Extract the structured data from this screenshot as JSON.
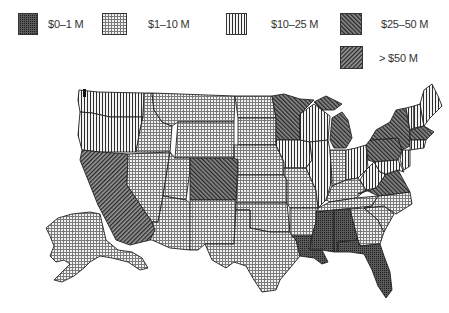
{
  "legend": {
    "items": [
      {
        "label": "$0–1 M",
        "pattern": "dense-dots",
        "color": "#3a3a3a"
      },
      {
        "label": "$1–10 M",
        "pattern": "grid",
        "color": "#8a8a8a"
      },
      {
        "label": "$10–25 M",
        "pattern": "vertical-lines",
        "color": "#444444"
      },
      {
        "label": "$25–50 M",
        "pattern": "diagonal-back",
        "color": "#444444"
      },
      {
        "label": "> $50 M",
        "pattern": "diagonal-forward",
        "color": "#444444"
      }
    ]
  },
  "map": {
    "title": "United States map shaded by funding category",
    "states": [
      {
        "name": "Washington",
        "category": "$10–25 M"
      },
      {
        "name": "Oregon",
        "category": "$10–25 M"
      },
      {
        "name": "California",
        "category": "> $50 M"
      },
      {
        "name": "Idaho",
        "category": "$1–10 M"
      },
      {
        "name": "Nevada",
        "category": "$1–10 M"
      },
      {
        "name": "Montana",
        "category": "$1–10 M"
      },
      {
        "name": "Wyoming",
        "category": "$1–10 M"
      },
      {
        "name": "Utah",
        "category": "$1–10 M"
      },
      {
        "name": "Arizona",
        "category": "$1–10 M"
      },
      {
        "name": "Colorado",
        "category": "$25–50 M"
      },
      {
        "name": "New Mexico",
        "category": "$1–10 M"
      },
      {
        "name": "North Dakota",
        "category": "$1–10 M"
      },
      {
        "name": "South Dakota",
        "category": "$1–10 M"
      },
      {
        "name": "Nebraska",
        "category": "$1–10 M"
      },
      {
        "name": "Kansas",
        "category": "$1–10 M"
      },
      {
        "name": "Oklahoma",
        "category": "$1–10 M"
      },
      {
        "name": "Texas",
        "category": "$1–10 M"
      },
      {
        "name": "Minnesota",
        "category": "$25–50 M"
      },
      {
        "name": "Iowa",
        "category": "$10–25 M"
      },
      {
        "name": "Missouri",
        "category": "$1–10 M"
      },
      {
        "name": "Arkansas",
        "category": "$1–10 M"
      },
      {
        "name": "Louisiana",
        "category": "$0–1 M"
      },
      {
        "name": "Wisconsin",
        "category": "$10–25 M"
      },
      {
        "name": "Illinois",
        "category": "$10–25 M"
      },
      {
        "name": "Michigan",
        "category": "$25–50 M"
      },
      {
        "name": "Indiana",
        "category": "$1–10 M"
      },
      {
        "name": "Ohio",
        "category": "$10–25 M"
      },
      {
        "name": "Kentucky",
        "category": "$1–10 M"
      },
      {
        "name": "Tennessee",
        "category": "$1–10 M"
      },
      {
        "name": "Mississippi",
        "category": "$0–1 M"
      },
      {
        "name": "Alabama",
        "category": "$0–1 M"
      },
      {
        "name": "Georgia",
        "category": "$1–10 M"
      },
      {
        "name": "Florida",
        "category": "$0–1 M"
      },
      {
        "name": "South Carolina",
        "category": "$1–10 M"
      },
      {
        "name": "North Carolina",
        "category": "$1–10 M"
      },
      {
        "name": "Virginia",
        "category": "$25–50 M"
      },
      {
        "name": "West Virginia",
        "category": "$10–25 M"
      },
      {
        "name": "Pennsylvania",
        "category": "$25–50 M"
      },
      {
        "name": "New York",
        "category": "$25–50 M"
      },
      {
        "name": "Maryland",
        "category": "$10–25 M"
      },
      {
        "name": "New Jersey",
        "category": "$10–25 M"
      },
      {
        "name": "Vermont",
        "category": "$10–25 M"
      },
      {
        "name": "New Hampshire",
        "category": "$10–25 M"
      },
      {
        "name": "Maine",
        "category": "$10–25 M"
      },
      {
        "name": "Massachusetts",
        "category": "$25–50 M"
      },
      {
        "name": "Connecticut",
        "category": "$10–25 M"
      },
      {
        "name": "Alaska",
        "category": "$1–10 M"
      }
    ]
  }
}
